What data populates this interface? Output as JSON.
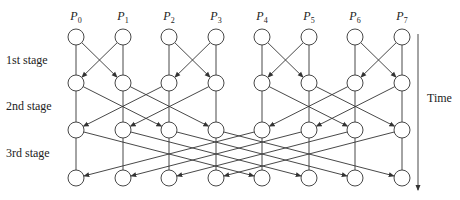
{
  "diagram": {
    "title": "",
    "processors": [
      "P0",
      "P1",
      "P2",
      "P3",
      "P4",
      "P5",
      "P6",
      "P7"
    ],
    "processor_labels": [
      {
        "base": "P",
        "sub": "0"
      },
      {
        "base": "P",
        "sub": "1"
      },
      {
        "base": "P",
        "sub": "2"
      },
      {
        "base": "P",
        "sub": "3"
      },
      {
        "base": "P",
        "sub": "4"
      },
      {
        "base": "P",
        "sub": "5"
      },
      {
        "base": "P",
        "sub": "6"
      },
      {
        "base": "P",
        "sub": "7"
      }
    ],
    "stages": [
      {
        "label": "1st stage",
        "distance": 1
      },
      {
        "label": "2nd stage",
        "distance": 2
      },
      {
        "label": "3rd stage",
        "distance": 4
      }
    ],
    "time_label": "Time",
    "layout": {
      "columns_x": [
        76,
        123,
        169,
        216,
        262,
        309,
        355,
        402
      ],
      "rows_y": [
        37,
        83,
        130,
        178
      ],
      "node_radius": 8,
      "time_arrow_x": 418,
      "time_arrow_y": [
        34,
        190
      ]
    },
    "colors": {
      "stroke": "#333333",
      "node_fill": "#ffffff",
      "text": "#222222"
    }
  }
}
